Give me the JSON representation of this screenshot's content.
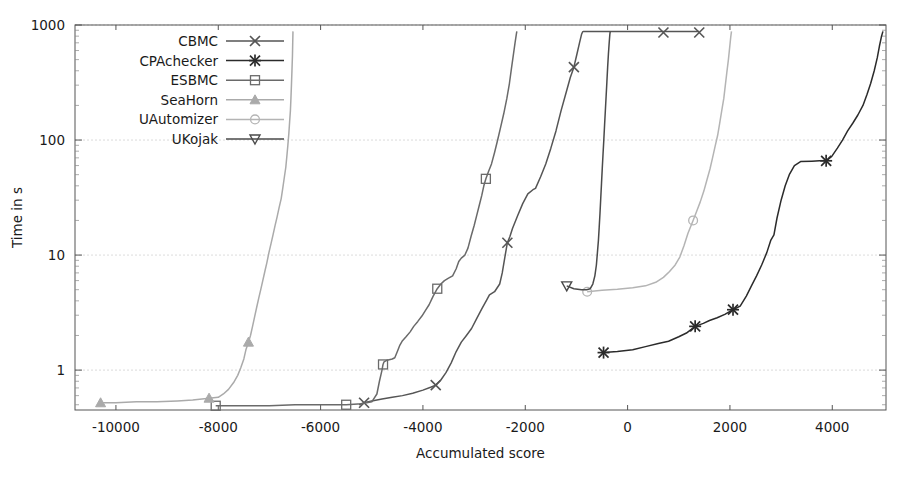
{
  "chart_data": {
    "type": "line",
    "title": "",
    "xlabel": "Accumulated score",
    "ylabel": "Time in s",
    "xlim": [
      -10800,
      5050
    ],
    "ylim": [
      0.45,
      1000
    ],
    "yscale": "log",
    "xticks": [
      -10000,
      -8000,
      -6000,
      -4000,
      -2000,
      0,
      2000,
      4000
    ],
    "xtick_labels": [
      "-10000",
      "-8000",
      "-6000",
      "-4000",
      "-2000",
      "0",
      "2000",
      "4000"
    ],
    "yticks": [
      1,
      10,
      100,
      1000
    ],
    "ytick_labels": [
      "1",
      "10",
      "100",
      "1000"
    ],
    "grid": true,
    "legend_position": "upper-left-inside",
    "series": [
      {
        "name": "CBMC",
        "marker": "x-cross",
        "color": "#555555",
        "marker_points": [
          [
            -5150,
            0.52
          ],
          [
            -3750,
            0.74
          ],
          [
            -2350,
            12.8
          ],
          [
            -1050,
            430
          ],
          [
            700,
            860
          ],
          [
            1400,
            860
          ]
        ],
        "points": [
          [
            -5250,
            0.5
          ],
          [
            -5150,
            0.52
          ],
          [
            -5000,
            0.54
          ],
          [
            -4800,
            0.56
          ],
          [
            -4600,
            0.58
          ],
          [
            -4400,
            0.6
          ],
          [
            -4200,
            0.63
          ],
          [
            -4000,
            0.67
          ],
          [
            -3850,
            0.71
          ],
          [
            -3750,
            0.74
          ],
          [
            -3650,
            0.82
          ],
          [
            -3550,
            0.95
          ],
          [
            -3450,
            1.15
          ],
          [
            -3350,
            1.45
          ],
          [
            -3250,
            1.75
          ],
          [
            -3150,
            2.0
          ],
          [
            -3050,
            2.3
          ],
          [
            -2950,
            2.8
          ],
          [
            -2850,
            3.4
          ],
          [
            -2750,
            4.1
          ],
          [
            -2700,
            4.5
          ],
          [
            -2600,
            4.8
          ],
          [
            -2500,
            5.6
          ],
          [
            -2450,
            7.0
          ],
          [
            -2400,
            9.5
          ],
          [
            -2350,
            12.8
          ],
          [
            -2300,
            14.5
          ],
          [
            -2250,
            17.0
          ],
          [
            -2150,
            22.0
          ],
          [
            -2050,
            28.0
          ],
          [
            -1950,
            34.0
          ],
          [
            -1850,
            37.0
          ],
          [
            -1800,
            38.0
          ],
          [
            -1700,
            48.0
          ],
          [
            -1600,
            62.0
          ],
          [
            -1500,
            85.0
          ],
          [
            -1400,
            120.0
          ],
          [
            -1300,
            180.0
          ],
          [
            -1200,
            260.0
          ],
          [
            -1120,
            350.0
          ],
          [
            -1050,
            430.0
          ],
          [
            -990,
            560.0
          ],
          [
            -940,
            700.0
          ],
          [
            -900,
            830.0
          ],
          [
            -880,
            870.0
          ],
          [
            -860,
            880.0
          ],
          [
            700,
            880.0
          ],
          [
            1400,
            880.0
          ]
        ]
      },
      {
        "name": "CPAchecker",
        "marker": "asterisk",
        "color": "#2b2b2b",
        "marker_points": [
          [
            -470,
            1.42
          ],
          [
            1320,
            2.4
          ],
          [
            2060,
            3.35
          ],
          [
            3880,
            66.0
          ]
        ],
        "points": [
          [
            -470,
            1.42
          ],
          [
            -200,
            1.45
          ],
          [
            100,
            1.5
          ],
          [
            350,
            1.6
          ],
          [
            600,
            1.7
          ],
          [
            800,
            1.78
          ],
          [
            1000,
            1.95
          ],
          [
            1150,
            2.1
          ],
          [
            1320,
            2.4
          ],
          [
            1480,
            2.55
          ],
          [
            1600,
            2.7
          ],
          [
            1750,
            2.85
          ],
          [
            1900,
            3.05
          ],
          [
            2060,
            3.35
          ],
          [
            2200,
            3.6
          ],
          [
            2320,
            4.4
          ],
          [
            2420,
            5.4
          ],
          [
            2520,
            6.6
          ],
          [
            2620,
            8.2
          ],
          [
            2720,
            10.5
          ],
          [
            2800,
            13.5
          ],
          [
            2860,
            15.0
          ],
          [
            2920,
            21.0
          ],
          [
            3000,
            30.0
          ],
          [
            3080,
            40.0
          ],
          [
            3160,
            50.0
          ],
          [
            3260,
            60.0
          ],
          [
            3380,
            65.0
          ],
          [
            3600,
            65.5
          ],
          [
            3750,
            66.0
          ],
          [
            3880,
            66.0
          ],
          [
            3990,
            72.0
          ],
          [
            4100,
            85.0
          ],
          [
            4200,
            100.0
          ],
          [
            4300,
            120.0
          ],
          [
            4400,
            140.0
          ],
          [
            4500,
            165.0
          ],
          [
            4600,
            200.0
          ],
          [
            4680,
            250.0
          ],
          [
            4750,
            310.0
          ],
          [
            4820,
            400.0
          ],
          [
            4880,
            520.0
          ],
          [
            4920,
            650.0
          ],
          [
            4960,
            790.0
          ],
          [
            4990,
            880.0
          ]
        ]
      },
      {
        "name": "ESBMC",
        "marker": "square-open",
        "color": "#6a6a6a",
        "marker_points": [
          [
            -8050,
            0.49
          ],
          [
            -5500,
            0.5
          ],
          [
            -4780,
            1.12
          ],
          [
            -3720,
            5.1
          ],
          [
            -2770,
            46.0
          ]
        ],
        "points": [
          [
            -8050,
            0.49
          ],
          [
            -7500,
            0.49
          ],
          [
            -7000,
            0.49
          ],
          [
            -6500,
            0.5
          ],
          [
            -6000,
            0.5
          ],
          [
            -5500,
            0.5
          ],
          [
            -5200,
            0.51
          ],
          [
            -5000,
            0.53
          ],
          [
            -4900,
            0.62
          ],
          [
            -4850,
            0.8
          ],
          [
            -4800,
            1.0
          ],
          [
            -4780,
            1.12
          ],
          [
            -4760,
            1.18
          ],
          [
            -4700,
            1.22
          ],
          [
            -4600,
            1.25
          ],
          [
            -4550,
            1.28
          ],
          [
            -4500,
            1.45
          ],
          [
            -4450,
            1.65
          ],
          [
            -4400,
            1.8
          ],
          [
            -4330,
            1.95
          ],
          [
            -4250,
            2.15
          ],
          [
            -4180,
            2.4
          ],
          [
            -4100,
            2.65
          ],
          [
            -4020,
            2.95
          ],
          [
            -3950,
            3.3
          ],
          [
            -3880,
            3.7
          ],
          [
            -3800,
            4.4
          ],
          [
            -3720,
            5.1
          ],
          [
            -3650,
            5.6
          ],
          [
            -3580,
            6.0
          ],
          [
            -3500,
            6.3
          ],
          [
            -3420,
            6.6
          ],
          [
            -3350,
            7.6
          ],
          [
            -3300,
            8.8
          ],
          [
            -3250,
            9.4
          ],
          [
            -3180,
            10.0
          ],
          [
            -3120,
            11.5
          ],
          [
            -3060,
            14.5
          ],
          [
            -3000,
            18.0
          ],
          [
            -2950,
            22.0
          ],
          [
            -2900,
            27.0
          ],
          [
            -2850,
            33.0
          ],
          [
            -2810,
            40.0
          ],
          [
            -2770,
            46.0
          ],
          [
            -2720,
            53.0
          ],
          [
            -2660,
            62.0
          ],
          [
            -2600,
            78.0
          ],
          [
            -2540,
            100.0
          ],
          [
            -2480,
            130.0
          ],
          [
            -2420,
            170.0
          ],
          [
            -2360,
            230.0
          ],
          [
            -2310,
            310.0
          ],
          [
            -2270,
            420.0
          ],
          [
            -2230,
            560.0
          ],
          [
            -2200,
            700.0
          ],
          [
            -2175,
            830.0
          ],
          [
            -2165,
            880.0
          ]
        ]
      },
      {
        "name": "SeaHorn",
        "marker": "triangle-up",
        "color": "#aaaaaa",
        "marker_points": [
          [
            -10300,
            0.52
          ],
          [
            -8180,
            0.57
          ],
          [
            -7410,
            1.75
          ]
        ],
        "points": [
          [
            -10300,
            0.52
          ],
          [
            -10000,
            0.52
          ],
          [
            -9600,
            0.53
          ],
          [
            -9200,
            0.53
          ],
          [
            -8800,
            0.54
          ],
          [
            -8500,
            0.55
          ],
          [
            -8180,
            0.57
          ],
          [
            -8000,
            0.58
          ],
          [
            -7900,
            0.62
          ],
          [
            -7800,
            0.68
          ],
          [
            -7700,
            0.78
          ],
          [
            -7620,
            0.9
          ],
          [
            -7560,
            1.05
          ],
          [
            -7500,
            1.25
          ],
          [
            -7460,
            1.5
          ],
          [
            -7410,
            1.75
          ],
          [
            -7370,
            2.0
          ],
          [
            -7330,
            2.4
          ],
          [
            -7290,
            2.9
          ],
          [
            -7250,
            3.5
          ],
          [
            -7210,
            4.2
          ],
          [
            -7170,
            5.0
          ],
          [
            -7130,
            6.0
          ],
          [
            -7090,
            7.2
          ],
          [
            -7050,
            8.6
          ],
          [
            -7010,
            10.5
          ],
          [
            -6970,
            12.5
          ],
          [
            -6930,
            15.0
          ],
          [
            -6890,
            18.0
          ],
          [
            -6850,
            21.5
          ],
          [
            -6810,
            26.0
          ],
          [
            -6770,
            31.0
          ],
          [
            -6740,
            38.0
          ],
          [
            -6710,
            47.0
          ],
          [
            -6680,
            58.0
          ],
          [
            -6660,
            72.0
          ],
          [
            -6640,
            90.0
          ],
          [
            -6620,
            115.0
          ],
          [
            -6605,
            145.0
          ],
          [
            -6590,
            180.0
          ],
          [
            -6580,
            230.0
          ],
          [
            -6570,
            300.0
          ],
          [
            -6560,
            400.0
          ],
          [
            -6550,
            540.0
          ],
          [
            -6545,
            700.0
          ],
          [
            -6540,
            880.0
          ]
        ]
      },
      {
        "name": "UAutomizer",
        "marker": "circle-open",
        "color": "#b4b4b4",
        "marker_points": [
          [
            -790,
            4.8
          ],
          [
            1280,
            20.0
          ]
        ],
        "points": [
          [
            -790,
            4.8
          ],
          [
            -500,
            4.95
          ],
          [
            -200,
            5.05
          ],
          [
            100,
            5.2
          ],
          [
            350,
            5.4
          ],
          [
            550,
            5.8
          ],
          [
            700,
            6.4
          ],
          [
            820,
            7.2
          ],
          [
            930,
            8.2
          ],
          [
            1020,
            9.6
          ],
          [
            1100,
            12.0
          ],
          [
            1180,
            15.5
          ],
          [
            1280,
            20.0
          ],
          [
            1350,
            24.0
          ],
          [
            1420,
            29.0
          ],
          [
            1490,
            36.0
          ],
          [
            1550,
            45.0
          ],
          [
            1610,
            56.0
          ],
          [
            1660,
            70.0
          ],
          [
            1710,
            88.0
          ],
          [
            1760,
            110.0
          ],
          [
            1800,
            140.0
          ],
          [
            1840,
            180.0
          ],
          [
            1880,
            230.0
          ],
          [
            1910,
            300.0
          ],
          [
            1940,
            390.0
          ],
          [
            1970,
            500.0
          ],
          [
            1995,
            640.0
          ],
          [
            2015,
            780.0
          ],
          [
            2030,
            880.0
          ]
        ]
      },
      {
        "name": "UKojak",
        "marker": "triangle-down",
        "color": "#4a4a4a",
        "marker_points": [
          [
            -1190,
            5.4
          ]
        ],
        "points": [
          [
            -1190,
            5.4
          ],
          [
            -1050,
            5.1
          ],
          [
            -900,
            5.0
          ],
          [
            -800,
            5.0
          ],
          [
            -730,
            5.1
          ],
          [
            -680,
            5.6
          ],
          [
            -640,
            6.6
          ],
          [
            -610,
            8.2
          ],
          [
            -590,
            10.5
          ],
          [
            -570,
            13.5
          ],
          [
            -555,
            17.5
          ],
          [
            -540,
            23.0
          ],
          [
            -525,
            31.0
          ],
          [
            -510,
            42.0
          ],
          [
            -495,
            57.0
          ],
          [
            -480,
            76.0
          ],
          [
            -465,
            100.0
          ],
          [
            -450,
            135.0
          ],
          [
            -435,
            180.0
          ],
          [
            -420,
            240.0
          ],
          [
            -405,
            320.0
          ],
          [
            -390,
            430.0
          ],
          [
            -375,
            560.0
          ],
          [
            -360,
            700.0
          ],
          [
            -348,
            820.0
          ],
          [
            -340,
            880.0
          ]
        ]
      }
    ]
  },
  "legend": {
    "items": [
      {
        "label": "CBMC"
      },
      {
        "label": "CPAchecker"
      },
      {
        "label": "ESBMC"
      },
      {
        "label": "SeaHorn"
      },
      {
        "label": "UAutomizer"
      },
      {
        "label": "UKojak"
      }
    ]
  }
}
